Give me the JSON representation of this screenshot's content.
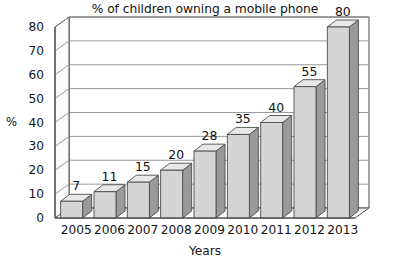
{
  "chart_data": {
    "type": "bar",
    "title": "",
    "subtitle": "% of children owning a mobile phone",
    "xlabel": "Years",
    "ylabel": "%",
    "categories": [
      "2005",
      "2006",
      "2007",
      "2008",
      "2009",
      "2010",
      "2011",
      "2012",
      "2013"
    ],
    "values": [
      7,
      11,
      15,
      20,
      28,
      35,
      40,
      55,
      80
    ],
    "value_labels": [
      "7",
      "11",
      "15",
      "20",
      "28",
      "35",
      "40",
      "55",
      "80"
    ],
    "ylim": [
      0,
      80
    ],
    "yticks": [
      "0",
      "10",
      "20",
      "30",
      "40",
      "50",
      "60",
      "70",
      "80"
    ],
    "ytick_values": [
      0,
      10,
      20,
      30,
      40,
      50,
      60,
      70,
      80
    ],
    "grid": true,
    "legend": "none",
    "style": "3d-column",
    "colors": {
      "bar_front": "#d5d5d5",
      "bar_side": "#9a9a9a",
      "bar_top": "#e8e8e8",
      "bar_outline": "#4d4d4d",
      "gridline": "#8c8c8c",
      "axis": "#4d4d4d",
      "background": "#ffffff",
      "text": "#141414"
    }
  }
}
